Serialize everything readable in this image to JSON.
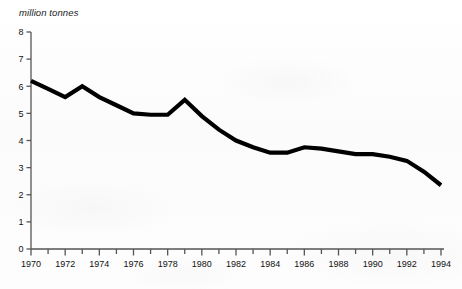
{
  "chart_data": {
    "type": "line",
    "title": "",
    "xlabel": "",
    "ylabel": "million tonnes",
    "ylim": [
      0,
      8
    ],
    "xlim": [
      1970,
      1994
    ],
    "grid": false,
    "legend": null,
    "y_ticks": [
      "0",
      "1",
      "2",
      "3",
      "4",
      "5",
      "6",
      "7",
      "8"
    ],
    "x_ticks_labeled": [
      "1970",
      "1972",
      "1974",
      "1976",
      "1978",
      "1980",
      "1982",
      "1984",
      "1986",
      "1988",
      "1990",
      "1992",
      "1994"
    ],
    "x_tick_interval_minor": 1,
    "x_tick_interval_major": 2,
    "line_color": "#000000",
    "line_width_px": 4.2,
    "axis_color": "#555555",
    "x": [
      1970,
      1971,
      1972,
      1973,
      1974,
      1975,
      1976,
      1977,
      1978,
      1979,
      1980,
      1981,
      1982,
      1983,
      1984,
      1985,
      1986,
      1987,
      1988,
      1989,
      1990,
      1991,
      1992,
      1993,
      1994
    ],
    "values": [
      6.2,
      5.9,
      5.6,
      6.0,
      5.6,
      5.3,
      5.0,
      4.95,
      4.95,
      5.5,
      4.9,
      4.4,
      4.0,
      3.75,
      3.55,
      3.55,
      3.75,
      3.7,
      3.6,
      3.5,
      3.5,
      3.4,
      3.25,
      2.85,
      2.35
    ],
    "series_name": "million tonnes"
  },
  "axis": {
    "y_caption": "million tonnes",
    "ghost_title": ""
  }
}
